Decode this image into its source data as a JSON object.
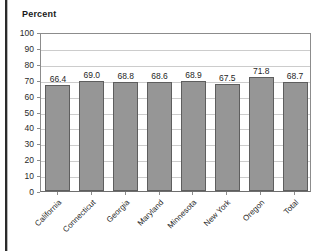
{
  "figure": {
    "axis_title": "Percent",
    "background_color": "#ffffff",
    "bar_color": "#969696",
    "bar_edge_color": "#5e5e5e",
    "grid_color": "#cccccc",
    "axis_color": "#8c8c8c"
  },
  "chart_data": {
    "type": "bar",
    "title": "",
    "subtitle": "",
    "xlabel": "",
    "ylabel": "Percent",
    "ylim": [
      0,
      100
    ],
    "yticks": [
      0,
      10,
      20,
      30,
      40,
      50,
      60,
      70,
      80,
      90,
      100
    ],
    "ytick_labels": [
      "0",
      "10",
      "20",
      "30",
      "40",
      "50",
      "60",
      "70",
      "80",
      "90",
      "100"
    ],
    "grid": true,
    "grid_axis": "y",
    "legend": false,
    "legend_position": "none",
    "categories": [
      "California",
      "Connecticut",
      "Georgia",
      "Maryland",
      "Minnesota",
      "New York",
      "Oregon",
      "Total"
    ],
    "values": [
      66.4,
      69.0,
      68.8,
      68.6,
      68.9,
      67.5,
      71.8,
      68.7
    ],
    "data_labels": [
      "66.4",
      "69.0",
      "68.8",
      "68.6",
      "68.9",
      "67.5",
      "71.8",
      "68.7"
    ],
    "tick_label_rotation": -45
  }
}
